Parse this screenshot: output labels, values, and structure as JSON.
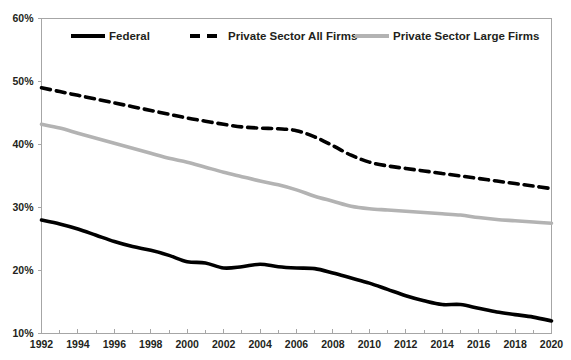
{
  "chart_data": {
    "type": "line",
    "title": "",
    "xlabel": "",
    "ylabel": "",
    "xlim": [
      1992,
      2020
    ],
    "ylim": [
      10,
      60
    ],
    "ytick_labels": [
      "60%",
      "50%",
      "40%",
      "30%",
      "20%",
      "10%"
    ],
    "ytick_values": [
      60,
      50,
      40,
      30,
      20,
      10
    ],
    "xtick_labels": [
      "1992",
      "1994",
      "1996",
      "1998",
      "2000",
      "2002",
      "2004",
      "2006",
      "2008",
      "2010",
      "2012",
      "2014",
      "2016",
      "2018",
      "2020"
    ],
    "xtick_values": [
      1992,
      1994,
      1996,
      1998,
      2000,
      2002,
      2004,
      2006,
      2008,
      2010,
      2012,
      2014,
      2016,
      2018,
      2020
    ],
    "minor_xticks": [
      1993,
      1995,
      1997,
      1999,
      2001,
      2003,
      2005,
      2007,
      2009,
      2011,
      2013,
      2015,
      2017,
      2019
    ],
    "grid": false,
    "legend_position": "top-inside",
    "x": [
      1992,
      1993,
      1994,
      1995,
      1996,
      1997,
      1998,
      1999,
      2000,
      2001,
      2002,
      2003,
      2004,
      2005,
      2006,
      2007,
      2008,
      2009,
      2010,
      2011,
      2012,
      2013,
      2014,
      2015,
      2016,
      2017,
      2018,
      2019,
      2020
    ],
    "series": [
      {
        "name": "Federal",
        "style": "solid",
        "color": "#000000",
        "width": 3.6,
        "values": [
          28.0,
          27.4,
          26.6,
          25.6,
          24.6,
          23.8,
          23.2,
          22.4,
          21.4,
          21.2,
          20.4,
          20.6,
          21.0,
          20.6,
          20.4,
          20.3,
          19.6,
          18.8,
          18.0,
          17.0,
          16.0,
          15.2,
          14.6,
          14.6,
          14.0,
          13.4,
          13.0,
          12.6,
          12.0
        ]
      },
      {
        "name": "Private Sector All Firms",
        "style": "dashed",
        "color": "#000000",
        "width": 3.6,
        "values": [
          49.0,
          48.4,
          47.8,
          47.2,
          46.6,
          46.0,
          45.4,
          44.8,
          44.2,
          43.7,
          43.2,
          42.8,
          42.6,
          42.5,
          42.2,
          41.2,
          39.8,
          38.3,
          37.2,
          36.6,
          36.2,
          35.8,
          35.4,
          35.0,
          34.6,
          34.2,
          33.8,
          33.4,
          33.0
        ]
      },
      {
        "name": "Private Sector Large Firms",
        "style": "solid",
        "color": "#b3b3b3",
        "width": 3.6,
        "values": [
          43.2,
          42.6,
          41.8,
          41.0,
          40.2,
          39.4,
          38.6,
          37.8,
          37.2,
          36.4,
          35.6,
          34.9,
          34.2,
          33.6,
          32.8,
          31.8,
          31.0,
          30.2,
          29.8,
          29.6,
          29.4,
          29.2,
          29.0,
          28.8,
          28.4,
          28.1,
          27.9,
          27.7,
          27.5
        ]
      }
    ]
  },
  "legend": {
    "items": [
      {
        "label": "Federal",
        "style": "solid",
        "color": "#000000"
      },
      {
        "label": "Private Sector All Firms",
        "style": "dashed",
        "color": "#000000"
      },
      {
        "label": "Private Sector Large Firms",
        "style": "solid",
        "color": "#b3b3b3"
      }
    ]
  }
}
